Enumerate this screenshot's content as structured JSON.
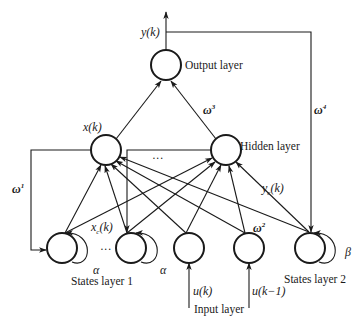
{
  "diagram": {
    "nodes": [
      {
        "id": "out",
        "layer": "output"
      },
      {
        "id": "h1",
        "layer": "hidden"
      },
      {
        "id": "h2",
        "layer": "hidden"
      },
      {
        "id": "s1a",
        "layer": "states1"
      },
      {
        "id": "s1b",
        "layer": "states1"
      },
      {
        "id": "u0",
        "layer": "input"
      },
      {
        "id": "u1",
        "layer": "input"
      },
      {
        "id": "s2",
        "layer": "states2"
      }
    ],
    "labels": {
      "output_signal": "y(k)",
      "output_layer": "Output layer",
      "hidden_out": "x(k)",
      "hidden_layer": "Hidden layer",
      "hidden_ellipsis": "···",
      "context_signal": "x",
      "context_signal_sub": "c",
      "context_signal_arg": "(k)",
      "states1_ellipsis": "···",
      "yc_signal": "y",
      "yc_signal_sub": "c",
      "yc_signal_arg": "(k)",
      "states_layer_1": "States layer 1",
      "states_layer_2": "States layer 2",
      "input_layer": "Input layer",
      "input_1": "u(k)",
      "input_2": "u(k−1)",
      "alpha_1": "α",
      "alpha_2": "α",
      "beta": "β"
    },
    "weights": {
      "w1": {
        "base": "ω",
        "sup": "1"
      },
      "w2": {
        "base": "ω",
        "sup": "2"
      },
      "w3": {
        "base": "ω",
        "sup": "3"
      },
      "w4": {
        "base": "ω",
        "sup": "4"
      }
    }
  }
}
